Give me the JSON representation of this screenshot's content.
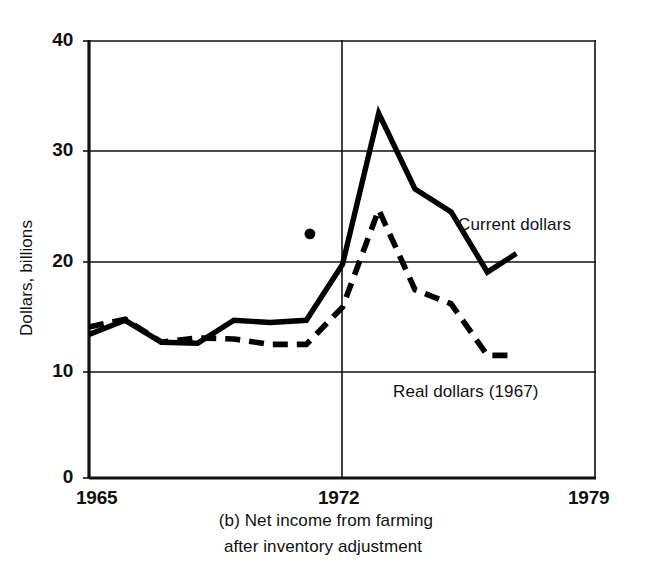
{
  "figure": {
    "caption_line_1": "(b)  Net income from farming",
    "caption_line_2": "after inventory adjustment"
  },
  "axes": {
    "y_title": "Dollars, billions",
    "y_ticks": [
      "40",
      "30",
      "20",
      "10",
      "0"
    ],
    "x_ticks": [
      "1965",
      "1972",
      "1979"
    ]
  },
  "labels": {
    "current_dollars": "Current dollars",
    "real_dollars": "Real dollars (1967)"
  },
  "chart_data": {
    "type": "line",
    "title": "(b)  Net income from farming after inventory adjustment",
    "xlabel": "",
    "ylabel": "Dollars, billions",
    "xlim": [
      1965,
      1979
    ],
    "ylim": [
      0,
      40
    ],
    "yticks": [
      0,
      10,
      20,
      30,
      40
    ],
    "xticks": [
      1965,
      1972,
      1979
    ],
    "grid": "horizontal gridlines at 10, 20, 30 plus vertical rule at 1972",
    "legend": "inline labels next to each curve",
    "series": [
      {
        "name": "Current dollars",
        "style": "solid",
        "color": "#000000",
        "x": [
          1965,
          1966,
          1967,
          1968,
          1969,
          1970,
          1971,
          1972,
          1973,
          1974,
          1975,
          1976,
          1976.8
        ],
        "values": [
          13.1,
          14.4,
          12.4,
          12.3,
          14.4,
          14.2,
          14.4,
          19.5,
          33.3,
          26.4,
          24.3,
          18.8,
          20.5
        ]
      },
      {
        "name": "Real dollars (1967)",
        "style": "dashed",
        "color": "#000000",
        "x": [
          1965,
          1966,
          1967,
          1968,
          1969,
          1970,
          1971,
          1972,
          1973,
          1974,
          1975,
          1976,
          1976.8
        ],
        "values": [
          13.8,
          14.5,
          12.4,
          12.8,
          12.7,
          12.2,
          12.2,
          15.6,
          24.5,
          17.2,
          15.9,
          11.2,
          11.2
        ]
      }
    ],
    "markers": [
      {
        "name": "single-point-marker",
        "x": 1971.1,
        "y": 22.3,
        "shape": "filled-circle"
      }
    ]
  }
}
